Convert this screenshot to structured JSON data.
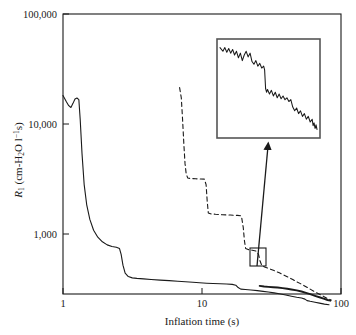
{
  "chart_data": {
    "type": "line",
    "title": "",
    "xlabel": "Inflation time (s)",
    "ylabel": "R₁ (cm-H₂O l⁻¹s)",
    "xscale": "log",
    "yscale": "log",
    "xlim": [
      1,
      100
    ],
    "ylim": [
      550,
      100000
    ],
    "xticks": [
      1,
      10,
      100
    ],
    "xtick_labels": [
      "1",
      "10",
      "100"
    ],
    "yticks": [
      1000,
      10000,
      100000
    ],
    "ytick_labels": [
      "1,000",
      "10,000",
      "100,000"
    ],
    "grid": false,
    "legend": null,
    "series": [
      {
        "name": "solid-main",
        "style": "solid",
        "color": "#1a1a1a",
        "width": 1.1,
        "points": [
          [
            1.0,
            22000
          ],
          [
            1.06,
            19500
          ],
          [
            1.1,
            18200
          ],
          [
            1.14,
            17600
          ],
          [
            1.18,
            19000
          ],
          [
            1.22,
            20600
          ],
          [
            1.26,
            21000
          ],
          [
            1.3,
            20400
          ],
          [
            1.33,
            14000
          ],
          [
            1.37,
            7500
          ],
          [
            1.42,
            4200
          ],
          [
            1.48,
            2900
          ],
          [
            1.56,
            2200
          ],
          [
            1.66,
            1800
          ],
          [
            1.78,
            1580
          ],
          [
            1.92,
            1450
          ],
          [
            2.08,
            1370
          ],
          [
            2.25,
            1330
          ],
          [
            2.42,
            1310
          ],
          [
            2.55,
            1280
          ],
          [
            2.62,
            1150
          ],
          [
            2.7,
            940
          ],
          [
            2.8,
            810
          ],
          [
            2.95,
            760
          ],
          [
            3.15,
            742
          ],
          [
            3.4,
            735
          ],
          [
            3.8,
            728
          ],
          [
            4.3,
            720
          ],
          [
            5.0,
            712
          ],
          [
            5.8,
            705
          ],
          [
            6.7,
            698
          ],
          [
            7.6,
            690
          ],
          [
            8.6,
            684
          ],
          [
            9.6,
            678
          ],
          [
            10.8,
            672
          ],
          [
            12.0,
            668
          ],
          [
            13.5,
            665
          ],
          [
            15.0,
            662
          ],
          [
            16.5,
            658
          ],
          [
            17.5,
            648
          ],
          [
            18.2,
            620
          ],
          [
            19.0,
            602
          ],
          [
            20.5,
            598
          ],
          [
            22.5,
            592
          ],
          [
            25.0,
            586
          ],
          [
            27.5,
            578
          ],
          [
            30.0,
            570
          ],
          [
            33.0,
            562
          ],
          [
            36.0,
            552
          ],
          [
            40.0,
            540
          ],
          [
            44.0,
            528
          ],
          [
            48.0,
            518
          ],
          [
            52.0,
            510
          ],
          [
            55.0,
            500
          ],
          [
            57.0,
            486
          ],
          [
            60.0,
            480
          ],
          [
            65.0,
            472
          ],
          [
            70.0,
            464
          ],
          [
            76.0,
            456
          ],
          [
            82.0,
            450
          ]
        ]
      },
      {
        "name": "solid-branch",
        "style": "solid",
        "color": "#1a1a1a",
        "width": 1.9,
        "points": [
          [
            26.0,
            640
          ],
          [
            28.0,
            632
          ],
          [
            30.0,
            628
          ],
          [
            32.5,
            624
          ],
          [
            35.0,
            620
          ],
          [
            38.0,
            614
          ],
          [
            41.0,
            606
          ],
          [
            44.0,
            598
          ],
          [
            48.0,
            588
          ],
          [
            52.0,
            576
          ],
          [
            56.0,
            562
          ],
          [
            60.0,
            548
          ],
          [
            65.0,
            532
          ],
          [
            70.0,
            518
          ],
          [
            75.0,
            504
          ],
          [
            80.0,
            492
          ],
          [
            84.0,
            486
          ]
        ]
      },
      {
        "name": "dashed",
        "style": "dashed",
        "color": "#1a1a1a",
        "width": 1.1,
        "points": [
          [
            6.9,
            25500
          ],
          [
            7.1,
            21000
          ],
          [
            7.25,
            14000
          ],
          [
            7.4,
            9000
          ],
          [
            7.55,
            6200
          ],
          [
            7.7,
            5100
          ],
          [
            7.9,
            4750
          ],
          [
            8.3,
            4700
          ],
          [
            9.0,
            4680
          ],
          [
            9.8,
            4660
          ],
          [
            10.4,
            4650
          ],
          [
            10.7,
            4200
          ],
          [
            10.9,
            3100
          ],
          [
            11.1,
            2480
          ],
          [
            11.5,
            2440
          ],
          [
            12.5,
            2420
          ],
          [
            14.0,
            2400
          ],
          [
            16.0,
            2385
          ],
          [
            18.0,
            2370
          ],
          [
            19.2,
            2350
          ],
          [
            19.8,
            1900
          ],
          [
            20.2,
            1480
          ],
          [
            20.6,
            1280
          ],
          [
            21.5,
            1255
          ],
          [
            23.0,
            1240
          ],
          [
            24.5,
            1220
          ],
          [
            25.5,
            1150
          ],
          [
            26.2,
            1010
          ],
          [
            27.0,
            930
          ],
          [
            28.5,
            905
          ],
          [
            30.5,
            880
          ],
          [
            33.0,
            850
          ],
          [
            36.0,
            815
          ],
          [
            39.0,
            780
          ],
          [
            42.0,
            748
          ],
          [
            45.0,
            720
          ],
          [
            48.0,
            690
          ],
          [
            52.0,
            660
          ],
          [
            56.0,
            630
          ],
          [
            60.0,
            602
          ],
          [
            65.0,
            572
          ],
          [
            70.0,
            548
          ],
          [
            75.0,
            526
          ],
          [
            80.0,
            505
          ],
          [
            85.0,
            492
          ]
        ]
      }
    ],
    "inset": {
      "name": "magnified-detail",
      "box_px": [
        217,
        39,
        103,
        99
      ],
      "source_box_px": [
        250,
        248,
        16,
        18
      ],
      "trace_style": "solid",
      "trace_color": "#1a1a1a",
      "points": [
        [
          0.0,
          0.94
        ],
        [
          0.03,
          0.9
        ],
        [
          0.05,
          0.94
        ],
        [
          0.07,
          0.89
        ],
        [
          0.09,
          0.93
        ],
        [
          0.11,
          0.88
        ],
        [
          0.13,
          0.92
        ],
        [
          0.15,
          0.86
        ],
        [
          0.17,
          0.9
        ],
        [
          0.19,
          0.83
        ],
        [
          0.21,
          0.88
        ],
        [
          0.23,
          0.8
        ],
        [
          0.25,
          0.86
        ],
        [
          0.27,
          0.9
        ],
        [
          0.29,
          0.84
        ],
        [
          0.31,
          0.88
        ],
        [
          0.33,
          0.79
        ],
        [
          0.35,
          0.76
        ],
        [
          0.37,
          0.8
        ],
        [
          0.39,
          0.74
        ],
        [
          0.41,
          0.77
        ],
        [
          0.43,
          0.72
        ],
        [
          0.45,
          0.74
        ],
        [
          0.46,
          0.7
        ],
        [
          0.47,
          0.5
        ],
        [
          0.48,
          0.46
        ],
        [
          0.49,
          0.49
        ],
        [
          0.51,
          0.44
        ],
        [
          0.53,
          0.48
        ],
        [
          0.55,
          0.42
        ],
        [
          0.57,
          0.46
        ],
        [
          0.59,
          0.4
        ],
        [
          0.61,
          0.44
        ],
        [
          0.63,
          0.39
        ],
        [
          0.65,
          0.42
        ],
        [
          0.67,
          0.38
        ],
        [
          0.69,
          0.4
        ],
        [
          0.71,
          0.36
        ],
        [
          0.73,
          0.38
        ],
        [
          0.75,
          0.3
        ],
        [
          0.77,
          0.26
        ],
        [
          0.79,
          0.29
        ],
        [
          0.81,
          0.23
        ],
        [
          0.83,
          0.26
        ],
        [
          0.85,
          0.2
        ],
        [
          0.87,
          0.23
        ],
        [
          0.89,
          0.17
        ],
        [
          0.91,
          0.2
        ],
        [
          0.93,
          0.14
        ],
        [
          0.95,
          0.17
        ],
        [
          0.96,
          0.1
        ],
        [
          0.97,
          0.13
        ],
        [
          0.98,
          0.07
        ],
        [
          0.99,
          0.11
        ],
        [
          1.0,
          0.06
        ]
      ]
    },
    "annotations": [
      {
        "name": "magnifier-arrow",
        "type": "arrow",
        "from_px": [
          257,
          266
        ],
        "to_px": [
          268,
          143
        ]
      }
    ]
  }
}
